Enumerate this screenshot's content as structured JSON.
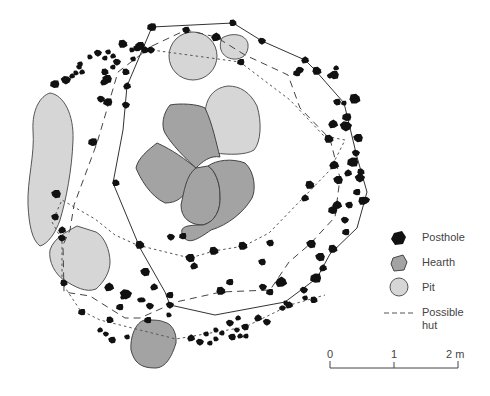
{
  "legend": {
    "items": [
      {
        "key": "posthole",
        "label": "Posthole",
        "icon": "posthole-icon"
      },
      {
        "key": "hearth",
        "label": "Hearth",
        "icon": "hearth-icon"
      },
      {
        "key": "pit",
        "label": "Pit",
        "icon": "pit-icon"
      },
      {
        "key": "hut",
        "label": "Possible hut",
        "label_line1": "Possible",
        "label_line2": "hut",
        "icon": "dashed-line-icon"
      }
    ]
  },
  "scale_bar": {
    "ticks": [
      "0",
      "1",
      "2 m"
    ],
    "unit": "m",
    "max": 2
  },
  "colors": {
    "posthole": "#111111",
    "hearth": "#a3a3a3",
    "pit": "#d6d6d6",
    "outline": "#444444"
  }
}
